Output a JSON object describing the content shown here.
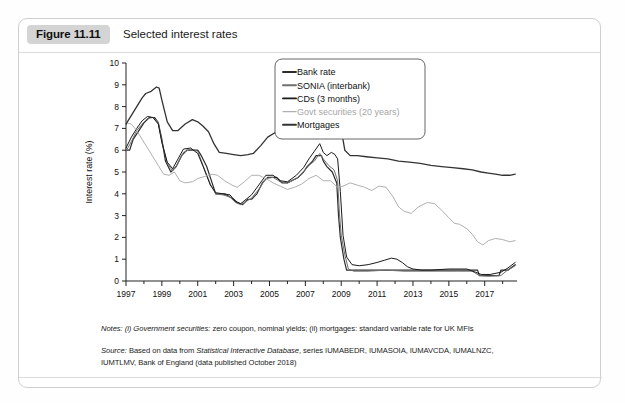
{
  "figure": {
    "badge_label": "Figure 11.11",
    "title": "Selected interest rates"
  },
  "notes": {
    "line1_prefix": "Notes:",
    "line1_italic": "(i) Government securities:",
    "line1_rest": " zero coupon, nominal yields; (ii) mortgages: standard variable rate for UK MFIs",
    "line2_prefix": "Source:",
    "line2_a": " Based on data from ",
    "line2_italic": "Statistical Interactive Database",
    "line2_b": ", series IUMABEDR, IUMASOIA, IUMAVCDA, IUMALNZC,",
    "line3": "IUMTLMV, Bank of England (data published October 2018)"
  },
  "colors": {
    "bank_rate": "#2b2b2b",
    "sonia": "#6f6f6f",
    "cds": "#1a1a1a",
    "govt": "#b0b0b0",
    "mortgages": "#333333",
    "axis": "#222222",
    "badge_bg": "#d4d4d4",
    "card_border": "#cfcfcf"
  },
  "chart_data": {
    "type": "line",
    "title": "Selected interest rates",
    "xlabel": "",
    "ylabel": "Interest rate (%)",
    "xlim": [
      1997,
      2018.8
    ],
    "ylim": [
      0,
      10
    ],
    "yticks": [
      0,
      1,
      2,
      3,
      4,
      5,
      6,
      7,
      8,
      9,
      10
    ],
    "xticks": [
      1997,
      1999,
      2001,
      2003,
      2005,
      2007,
      2009,
      2011,
      2013,
      2015,
      2017
    ],
    "xminorticks": [
      1998,
      2000,
      2002,
      2004,
      2006,
      2008,
      2010,
      2012,
      2014,
      2016,
      2018
    ],
    "grid": false,
    "legend_position": "top-right",
    "series": [
      {
        "name": "Bank rate",
        "color": "#2b2b2b",
        "width": 1.2,
        "x": [
          1997.0,
          1997.2,
          1997.4,
          1997.6,
          1997.8,
          1998.0,
          1998.3,
          1998.6,
          1998.8,
          1999.0,
          1999.2,
          1999.5,
          1999.8,
          2000.1,
          2000.4,
          2000.8,
          2001.0,
          2001.2,
          2001.5,
          2001.8,
          2002.0,
          2002.5,
          2003.0,
          2003.2,
          2003.5,
          2003.8,
          2004.0,
          2004.3,
          2004.6,
          2004.9,
          2005.4,
          2005.7,
          2006.0,
          2006.6,
          2006.9,
          2007.1,
          2007.4,
          2007.6,
          2007.9,
          2008.0,
          2008.2,
          2008.5,
          2008.75,
          2008.85,
          2008.95,
          2009.05,
          2009.15,
          2009.3,
          2009.5,
          2010.0,
          2011.0,
          2012.0,
          2013.0,
          2014.0,
          2015.0,
          2016.0,
          2016.6,
          2016.7,
          2017.0,
          2017.8,
          2017.9,
          2018.3,
          2018.7
        ],
        "y": [
          6.0,
          6.0,
          6.5,
          6.75,
          7.0,
          7.25,
          7.5,
          7.5,
          7.25,
          6.5,
          5.5,
          5.0,
          5.25,
          5.75,
          6.0,
          6.0,
          6.0,
          5.75,
          5.25,
          4.5,
          4.0,
          4.0,
          3.75,
          3.6,
          3.5,
          3.75,
          3.75,
          4.0,
          4.5,
          4.75,
          4.75,
          4.5,
          4.5,
          4.75,
          5.0,
          5.25,
          5.5,
          5.75,
          5.75,
          5.5,
          5.25,
          5.0,
          4.5,
          3.0,
          2.0,
          1.5,
          1.0,
          0.5,
          0.5,
          0.5,
          0.5,
          0.5,
          0.5,
          0.5,
          0.5,
          0.5,
          0.5,
          0.25,
          0.25,
          0.25,
          0.5,
          0.5,
          0.75
        ]
      },
      {
        "name": "SONIA (interbank)",
        "color": "#6f6f6f",
        "width": 1.0,
        "x": [
          1997.0,
          1997.3,
          1997.6,
          1997.9,
          1998.2,
          1998.5,
          1998.8,
          1999.0,
          1999.3,
          1999.6,
          1999.9,
          2000.2,
          2000.6,
          2001.0,
          2001.3,
          2001.7,
          2002.0,
          2002.4,
          2002.8,
          2003.1,
          2003.4,
          2003.7,
          2004.0,
          2004.4,
          2004.8,
          2005.2,
          2005.6,
          2006.0,
          2006.5,
          2006.9,
          2007.2,
          2007.5,
          2007.8,
          2008.0,
          2008.3,
          2008.6,
          2008.8,
          2008.9,
          2009.0,
          2009.2,
          2009.4,
          2009.7,
          2010.5,
          2011.5,
          2012.5,
          2013.5,
          2014.5,
          2015.5,
          2016.3,
          2016.7,
          2017.2,
          2017.9,
          2018.2,
          2018.7
        ],
        "y": [
          5.95,
          6.4,
          6.9,
          7.2,
          7.45,
          7.5,
          7.3,
          6.4,
          5.4,
          5.05,
          5.4,
          5.9,
          6.05,
          5.95,
          5.3,
          4.45,
          4.0,
          3.95,
          3.85,
          3.6,
          3.5,
          3.65,
          3.8,
          4.2,
          4.7,
          4.75,
          4.55,
          4.5,
          4.7,
          5.0,
          5.3,
          5.5,
          5.85,
          5.6,
          5.3,
          5.1,
          4.6,
          3.1,
          2.1,
          1.2,
          0.55,
          0.45,
          0.45,
          0.5,
          0.45,
          0.45,
          0.45,
          0.45,
          0.45,
          0.25,
          0.22,
          0.25,
          0.45,
          0.7
        ]
      },
      {
        "name": "CDs (3 months)",
        "color": "#1a1a1a",
        "width": 1.0,
        "x": [
          1997.0,
          1997.3,
          1997.6,
          1997.9,
          1998.2,
          1998.5,
          1998.8,
          1999.0,
          1999.3,
          1999.6,
          1999.9,
          2000.2,
          2000.6,
          2001.0,
          2001.3,
          2001.7,
          2002.0,
          2002.4,
          2002.8,
          2003.1,
          2003.4,
          2003.7,
          2004.0,
          2004.4,
          2004.8,
          2005.2,
          2005.6,
          2006.0,
          2006.5,
          2006.9,
          2007.2,
          2007.5,
          2007.8,
          2008.0,
          2008.2,
          2008.45,
          2008.65,
          2008.8,
          2008.95,
          2009.1,
          2009.3,
          2009.6,
          2010.0,
          2010.5,
          2011.0,
          2011.4,
          2011.8,
          2012.1,
          2012.4,
          2012.7,
          2013.0,
          2013.5,
          2014.0,
          2015.0,
          2016.0,
          2016.5,
          2016.8,
          2017.3,
          2017.9,
          2018.3,
          2018.7
        ],
        "y": [
          6.1,
          6.6,
          7.0,
          7.35,
          7.55,
          7.5,
          7.2,
          6.35,
          5.45,
          5.15,
          5.6,
          6.05,
          6.1,
          5.85,
          5.25,
          4.4,
          4.05,
          4.0,
          3.95,
          3.65,
          3.55,
          3.75,
          3.95,
          4.4,
          4.85,
          4.85,
          4.6,
          4.55,
          4.85,
          5.2,
          5.6,
          5.95,
          6.3,
          5.9,
          5.75,
          5.9,
          5.8,
          5.6,
          4.1,
          2.1,
          1.1,
          0.75,
          0.7,
          0.75,
          0.85,
          0.95,
          1.05,
          1.0,
          0.85,
          0.65,
          0.55,
          0.5,
          0.5,
          0.55,
          0.55,
          0.4,
          0.3,
          0.3,
          0.4,
          0.6,
          0.85
        ]
      },
      {
        "name": "Govt securities (20 years)",
        "color": "#b0b0b0",
        "width": 1.0,
        "x": [
          1997.0,
          1997.3,
          1997.6,
          1997.9,
          1998.2,
          1998.5,
          1998.8,
          1999.1,
          1999.4,
          1999.7,
          2000.0,
          2000.3,
          2000.7,
          2001.0,
          2001.4,
          2001.8,
          2002.1,
          2002.5,
          2002.9,
          2003.2,
          2003.6,
          2004.0,
          2004.4,
          2004.8,
          2005.2,
          2005.6,
          2006.0,
          2006.4,
          2006.8,
          2007.2,
          2007.6,
          2008.0,
          2008.4,
          2008.8,
          2009.1,
          2009.5,
          2009.9,
          2010.3,
          2010.7,
          2011.1,
          2011.5,
          2011.9,
          2012.2,
          2012.5,
          2012.9,
          2013.3,
          2013.8,
          2014.2,
          2014.6,
          2015.0,
          2015.3,
          2015.6,
          2016.0,
          2016.3,
          2016.6,
          2016.9,
          2017.2,
          2017.6,
          2018.0,
          2018.4,
          2018.7
        ],
        "y": [
          7.25,
          7.2,
          6.9,
          6.5,
          6.1,
          5.7,
          5.3,
          4.9,
          4.85,
          5.0,
          4.6,
          4.5,
          4.55,
          4.7,
          4.8,
          4.9,
          4.85,
          4.6,
          4.4,
          4.3,
          4.55,
          4.85,
          4.85,
          4.7,
          4.5,
          4.35,
          4.2,
          4.3,
          4.45,
          4.7,
          4.85,
          4.6,
          4.6,
          4.3,
          4.35,
          4.5,
          4.4,
          4.3,
          4.15,
          4.35,
          4.3,
          3.85,
          3.4,
          3.2,
          3.1,
          3.4,
          3.6,
          3.55,
          3.25,
          2.9,
          2.65,
          2.6,
          2.4,
          2.15,
          1.8,
          1.65,
          1.85,
          1.95,
          1.9,
          1.8,
          1.85
        ]
      },
      {
        "name": "Mortgages",
        "color": "#333333",
        "width": 1.3,
        "x": [
          1997.0,
          1997.3,
          1997.6,
          1997.9,
          1998.1,
          1998.4,
          1998.7,
          1998.85,
          1999.0,
          1999.3,
          1999.6,
          1999.9,
          2000.3,
          2000.7,
          2001.0,
          2001.3,
          2001.6,
          2001.9,
          2002.2,
          2002.6,
          2003.0,
          2003.4,
          2003.8,
          2004.1,
          2004.5,
          2004.9,
          2005.3,
          2005.7,
          2006.1,
          2006.5,
          2006.9,
          2007.3,
          2007.6,
          2007.9,
          2008.1,
          2008.4,
          2008.7,
          2008.9,
          2009.0,
          2009.2,
          2009.5,
          2009.9,
          2010.4,
          2011.0,
          2011.6,
          2012.2,
          2012.8,
          2013.4,
          2014.0,
          2014.6,
          2015.2,
          2015.8,
          2016.3,
          2016.8,
          2017.2,
          2017.6,
          2018.0,
          2018.4,
          2018.7
        ],
        "y": [
          7.2,
          7.6,
          8.0,
          8.4,
          8.6,
          8.7,
          8.9,
          8.85,
          8.3,
          7.3,
          6.9,
          6.9,
          7.2,
          7.4,
          7.3,
          7.1,
          6.85,
          6.3,
          5.9,
          5.85,
          5.8,
          5.75,
          5.8,
          5.85,
          6.2,
          6.6,
          6.8,
          6.7,
          6.65,
          6.75,
          7.0,
          7.3,
          7.55,
          7.6,
          7.55,
          7.45,
          7.2,
          7.1,
          6.95,
          6.0,
          5.75,
          5.75,
          5.7,
          5.65,
          5.6,
          5.5,
          5.45,
          5.4,
          5.3,
          5.25,
          5.2,
          5.15,
          5.1,
          5.0,
          4.95,
          4.9,
          4.85,
          4.85,
          4.9
        ]
      }
    ]
  },
  "legend": {
    "items": [
      {
        "label": "Bank rate",
        "color": "#2b2b2b",
        "dim": false
      },
      {
        "label": "SONIA (interbank)",
        "color": "#6f6f6f",
        "dim": false
      },
      {
        "label": "CDs (3 months)",
        "color": "#1a1a1a",
        "dim": false
      },
      {
        "label": "Govt securities (20 years)",
        "color": "#b0b0b0",
        "dim": true
      },
      {
        "label": "Mortgages",
        "color": "#333333",
        "dim": false
      }
    ]
  }
}
